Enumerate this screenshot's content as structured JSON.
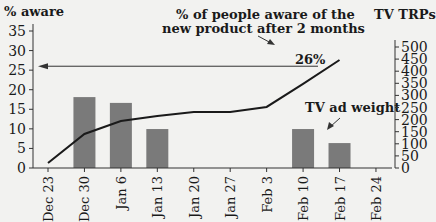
{
  "chart_data": {
    "type": "bar+line",
    "title": "",
    "categories": [
      "Dec 23",
      "Dec 30",
      "Jan 6",
      "Jan 13",
      "Jan 20",
      "Jan 27",
      "Feb 3",
      "Feb 10",
      "Feb 17",
      "Feb 24"
    ],
    "series": [
      {
        "name": "TV ad weight",
        "type": "bar",
        "axis": "right",
        "unit": "TV TRPs",
        "values": [
          0,
          293,
          269,
          161,
          0,
          0,
          0,
          161,
          103,
          0
        ]
      },
      {
        "name": "% aware",
        "type": "line",
        "axis": "left",
        "unit": "%",
        "values": [
          1.3,
          8.7,
          12.0,
          13.3,
          14.3,
          14.3,
          15.6,
          21.5,
          27.6,
          null
        ]
      }
    ],
    "left_axis": {
      "label": "% aware",
      "ylim": [
        0,
        35
      ],
      "ticks": [
        0,
        5,
        10,
        15,
        20,
        25,
        30,
        35
      ]
    },
    "right_axis": {
      "label": "TV TRPs",
      "ylim": [
        0,
        500
      ],
      "ticks": [
        0,
        50,
        100,
        150,
        200,
        250,
        300,
        350,
        400,
        450,
        500
      ]
    },
    "annotations": [
      {
        "text": "% of people aware of the new product after 2 months",
        "value": "26%",
        "reference_line_y": 26
      },
      {
        "text": "TV ad weight",
        "points_to": "bars"
      }
    ],
    "grid": false,
    "legend": "none"
  },
  "labels": {
    "left_axis_title": "% aware",
    "right_axis_title": "TV TRPs",
    "annotation_line1": "% of people aware of the",
    "annotation_line2": "new product after 2 months",
    "annotation_value": "26%",
    "bar_annotation": "TV ad weight"
  },
  "colors": {
    "bar": "#7a7a7a",
    "line": "#1a1a1a",
    "background": "#f2f2f0"
  }
}
